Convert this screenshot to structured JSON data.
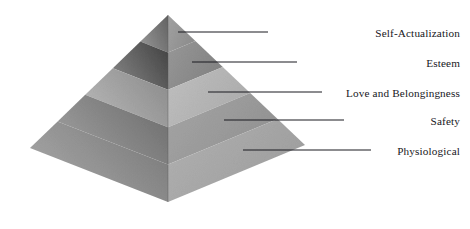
{
  "diagram": {
    "type": "maslow-hierarchy-pyramid",
    "background_color": "#ffffff",
    "line_color": "#1a1a20",
    "text_color": "#17171c",
    "apex": {
      "x": 168,
      "y": 15
    },
    "base_left": {
      "x": 30,
      "y": 148
    },
    "base_front": {
      "x": 168,
      "y": 202
    },
    "base_right": {
      "x": 305,
      "y": 145
    },
    "tiers": [
      {
        "id": "tier-self-actualization",
        "label": "Self-Actualization",
        "rank": 5,
        "label_y": 33,
        "leader_start_x": 178,
        "leader_end_x": 268,
        "left_face_color_top": "#6a6a6a",
        "left_face_color_bottom": "#8d8d8d",
        "right_face_color": "#9a9a9a"
      },
      {
        "id": "tier-esteem",
        "label": "Esteem",
        "rank": 4,
        "label_y": 63,
        "leader_start_x": 192,
        "leader_end_x": 297,
        "left_face_color_top": "#4a4a4a",
        "left_face_color_bottom": "#7a7a7a",
        "right_face_color": "#8f8f8f"
      },
      {
        "id": "tier-love-and-belongingness",
        "label": "Love and Belongingness",
        "rank": 3,
        "label_y": 93,
        "leader_start_x": 208,
        "leader_end_x": 322,
        "left_face_color_top": "#8e8e8e",
        "left_face_color_bottom": "#b0b0b0",
        "right_face_color": "#b8b8b8"
      },
      {
        "id": "tier-safety",
        "label": "Safety",
        "rank": 2,
        "label_y": 121,
        "leader_start_x": 224,
        "leader_end_x": 344,
        "left_face_color_top": "#717171",
        "left_face_color_bottom": "#979797",
        "right_face_color": "#9e9e9e"
      },
      {
        "id": "tier-physiological",
        "label": "Physiological",
        "rank": 1,
        "label_y": 151,
        "leader_start_x": 243,
        "leader_end_x": 371,
        "left_face_color_top": "#7d7d7d",
        "left_face_color_bottom": "#a1a1a1",
        "right_face_color": "#ababab"
      }
    ]
  }
}
